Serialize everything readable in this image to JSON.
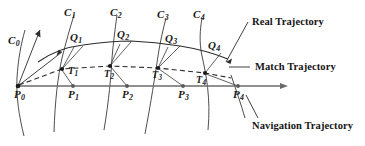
{
  "figure": {
    "type": "diagram",
    "background": "#ffffff",
    "stroke_color": "#3a3a3a",
    "text_color": "#151515",
    "width": 365,
    "height": 146,
    "axis": {
      "name": "navigation-axis",
      "from": [
        18,
        86
      ],
      "to": [
        288,
        86
      ],
      "arrow": true
    },
    "navigation_points": [
      {
        "label": "P",
        "sub": "0",
        "x": 18,
        "y": 86,
        "label_x": 14,
        "label_y": 89
      },
      {
        "label": "P",
        "sub": "1",
        "x": 73,
        "y": 86,
        "label_x": 68,
        "label_y": 89
      },
      {
        "label": "P",
        "sub": "2",
        "x": 127,
        "y": 86,
        "label_x": 122,
        "label_y": 89
      },
      {
        "label": "P",
        "sub": "3",
        "x": 183,
        "y": 86,
        "label_x": 178,
        "label_y": 89
      },
      {
        "label": "P",
        "sub": "4",
        "x": 238,
        "y": 86,
        "label_x": 233,
        "label_y": 89
      }
    ],
    "match_points": [
      {
        "label": "T",
        "sub": "1",
        "x": 62,
        "y": 69,
        "label_x": 68,
        "label_y": 66
      },
      {
        "label": "T",
        "sub": "2",
        "x": 110,
        "y": 66,
        "label_x": 104,
        "label_y": 69
      },
      {
        "label": "T",
        "sub": "3",
        "x": 158,
        "y": 68,
        "label_x": 152,
        "label_y": 70
      },
      {
        "label": "T",
        "sub": "4",
        "x": 205,
        "y": 73,
        "label_x": 196,
        "label_y": 75
      }
    ],
    "real_points": [
      {
        "label": "Q",
        "sub": "1",
        "x": 83,
        "y": 45,
        "label_x": 70,
        "label_y": 32
      },
      {
        "label": "Q",
        "sub": "2",
        "x": 131,
        "y": 41,
        "label_x": 117,
        "label_y": 29
      },
      {
        "label": "Q",
        "sub": "3",
        "x": 180,
        "y": 45,
        "label_x": 165,
        "label_y": 33
      },
      {
        "label": "Q",
        "sub": "4",
        "x": 222,
        "y": 52,
        "label_x": 208,
        "label_y": 40
      }
    ],
    "road_curves": [
      {
        "label": "C",
        "sub": "0",
        "label_x": 8,
        "label_y": 35
      },
      {
        "label": "C",
        "sub": "1",
        "label_x": 64,
        "label_y": 7
      },
      {
        "label": "C",
        "sub": "2",
        "label_x": 110,
        "label_y": 7
      },
      {
        "label": "C",
        "sub": "3",
        "label_x": 157,
        "label_y": 9
      },
      {
        "label": "C",
        "sub": "4",
        "label_x": 193,
        "label_y": 9
      }
    ],
    "legend": [
      {
        "name": "real-trajectory-label",
        "text": "Real Trajectory",
        "x": 252,
        "y": 17
      },
      {
        "name": "match-trajectory-label",
        "text": "Match Trajectory",
        "x": 255,
        "y": 62
      },
      {
        "name": "navigation-trajectory-label",
        "text": "Navigation Trajectory",
        "x": 252,
        "y": 121
      }
    ]
  }
}
